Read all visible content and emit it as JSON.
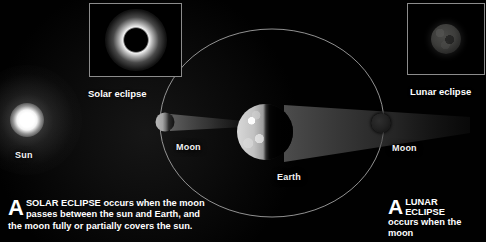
{
  "diagram": {
    "background_color": "#000000",
    "accent_color": "#ffffff"
  },
  "insets": [
    {
      "name": "solar-eclipse-photo",
      "caption": "Solar eclipse",
      "description": "total solar eclipse with white corona around black lunar disk"
    },
    {
      "name": "lunar-eclipse-photo",
      "caption": "Lunar eclipse",
      "description": "dim eclipsed moon disk"
    }
  ],
  "bodies": [
    {
      "name": "sun",
      "label": "Sun"
    },
    {
      "name": "moon-solar",
      "label": "Moon"
    },
    {
      "name": "earth",
      "label": "Earth"
    },
    {
      "name": "moon-lunar",
      "label": "Moon"
    }
  ],
  "orbit": {
    "name": "moon-orbit-ellipse",
    "label": ""
  },
  "text_blocks": {
    "solar": {
      "dropcap": "A",
      "keyword": "SOLAR ECLIPSE",
      "line1_rest": " occurs when the moon",
      "line2": "passes between the sun and Earth, and",
      "line3": "the moon fully or partially covers the sun."
    },
    "lunar": {
      "dropcap": "A",
      "keyword_line1": "LUNAR",
      "keyword_line2": "ECLIPSE",
      "line3": "occurs when the moon"
    }
  }
}
